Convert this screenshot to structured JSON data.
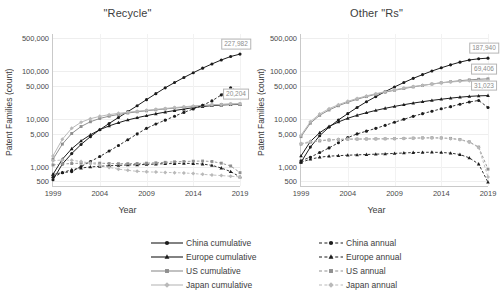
{
  "figure": {
    "xlabel": "Year",
    "ylabel": "Patent Families (count)"
  },
  "colors": {
    "china": "#1c1c1c",
    "europe": "#1c1c1c",
    "us": "#8f8f8f",
    "japan": "#b9b9b9",
    "grid": "#eeeeee",
    "axis": "#c9c9c9",
    "callout_text": "#8d8d8d"
  },
  "legend": {
    "left_column": [
      {
        "label": "China cumulative",
        "series": "china",
        "style": "solid",
        "marker": "circle"
      },
      {
        "label": "Europe cumulative",
        "series": "europe",
        "style": "solid",
        "marker": "triangle"
      },
      {
        "label": "US cumulative",
        "series": "us",
        "style": "solid",
        "marker": "square"
      },
      {
        "label": "Japan cumulative",
        "series": "japan",
        "style": "solid",
        "marker": "diamond"
      }
    ],
    "right_column": [
      {
        "label": "China annual",
        "series": "china",
        "style": "dashed",
        "marker": "circle"
      },
      {
        "label": "Europe annual",
        "series": "europe",
        "style": "dashed",
        "marker": "triangle"
      },
      {
        "label": "US annual",
        "series": "us",
        "style": "dashed",
        "marker": "square"
      },
      {
        "label": "Japan annual",
        "series": "japan",
        "style": "dashed",
        "marker": "diamond"
      }
    ]
  },
  "chart_data": [
    {
      "panel": "left",
      "type": "line",
      "title": "\"Recycle\"",
      "xlabel": "Year",
      "ylabel": "Patent Families (count)",
      "yscale": "log",
      "ylim": [
        400,
        600000
      ],
      "xlim": [
        1999,
        2019
      ],
      "grid": true,
      "legend_position": "below-figure",
      "yticks": [
        500,
        1000,
        5000,
        10000,
        50000,
        100000,
        500000
      ],
      "ytick_labels": [
        "500",
        "1,000",
        "5,000",
        "10,000",
        "50,000",
        "100,000",
        "500,000"
      ],
      "xticks": [
        1999,
        2004,
        2009,
        2014,
        2019
      ],
      "xtick_labels": [
        "1999",
        "2004",
        "2009",
        "2014",
        "2019"
      ],
      "x": [
        1999,
        2000,
        2001,
        2002,
        2003,
        2004,
        2005,
        2006,
        2007,
        2008,
        2009,
        2010,
        2011,
        2012,
        2013,
        2014,
        2015,
        2016,
        2017,
        2018,
        2019
      ],
      "series": [
        {
          "name": "China cumulative",
          "key": "china",
          "style": "solid",
          "marker": "circle",
          "values": [
            540,
            1150,
            1900,
            2950,
            4300,
            6000,
            8100,
            10800,
            14300,
            19000,
            25500,
            34000,
            45000,
            58000,
            74000,
            93000,
            116000,
            142000,
            172000,
            203000,
            227982
          ]
        },
        {
          "name": "Europe cumulative",
          "key": "europe",
          "style": "solid",
          "marker": "triangle",
          "values": [
            700,
            1450,
            2400,
            3500,
            4700,
            6000,
            7200,
            8400,
            9600,
            10700,
            11800,
            12900,
            14000,
            15100,
            16200,
            17300,
            18300,
            19100,
            19700,
            20100,
            20204
          ]
        },
        {
          "name": "US cumulative",
          "key": "us",
          "style": "solid",
          "marker": "square",
          "values": [
            1450,
            3000,
            5000,
            7000,
            8800,
            10300,
            11500,
            12500,
            13400,
            14200,
            14900,
            15600,
            16300,
            17000,
            17700,
            18400,
            19100,
            19700,
            20200,
            20600,
            20800
          ]
        },
        {
          "name": "Japan cumulative",
          "key": "japan",
          "style": "solid",
          "marker": "diamond",
          "values": [
            1700,
            3800,
            6400,
            8600,
            10200,
            11400,
            12400,
            13200,
            13900,
            14600,
            15300,
            16000,
            16700,
            17400,
            18100,
            18800,
            19400,
            19900,
            20300,
            20600,
            20800
          ]
        },
        {
          "name": "China annual",
          "key": "china",
          "style": "dashed",
          "marker": "circle",
          "values": [
            610,
            760,
            800,
            1020,
            1300,
            1650,
            2150,
            2800,
            3700,
            4900,
            6400,
            7900,
            9500,
            11500,
            13800,
            16300,
            19500,
            24000,
            32000,
            45000,
            37000
          ]
        },
        {
          "name": "Europe annual",
          "key": "europe",
          "style": "dashed",
          "marker": "triangle",
          "values": [
            700,
            760,
            880,
            950,
            1000,
            1030,
            1060,
            1080,
            1100,
            1110,
            1130,
            1150,
            1170,
            1180,
            1190,
            1180,
            1150,
            1080,
            950,
            800,
            620
          ]
        },
        {
          "name": "US annual",
          "key": "us",
          "style": "dashed",
          "marker": "square",
          "values": [
            1100,
            1150,
            1180,
            1200,
            1210,
            1200,
            1180,
            1170,
            1170,
            1180,
            1200,
            1220,
            1250,
            1280,
            1300,
            1320,
            1330,
            1300,
            1200,
            1050,
            760
          ]
        },
        {
          "name": "Japan annual",
          "key": "japan",
          "style": "dashed",
          "marker": "diamond",
          "values": [
            1350,
            1400,
            1380,
            1300,
            1200,
            1080,
            980,
            900,
            850,
            810,
            790,
            780,
            770,
            760,
            750,
            730,
            700,
            680,
            660,
            640,
            620
          ]
        }
      ],
      "annotations": [
        {
          "text": "227,982",
          "series": "China cumulative",
          "x": 2019,
          "y": 227982
        },
        {
          "text": "20,204",
          "series": "Europe cumulative",
          "x": 2019,
          "y": 20204
        }
      ]
    },
    {
      "panel": "right",
      "type": "line",
      "title": "Other \"Rs\"",
      "xlabel": "Year",
      "ylabel": "Patent Families (count)",
      "yscale": "log",
      "ylim": [
        400,
        600000
      ],
      "xlim": [
        1999,
        2019
      ],
      "grid": true,
      "legend_position": "below-figure",
      "yticks": [
        500,
        1000,
        5000,
        10000,
        50000,
        100000,
        500000
      ],
      "ytick_labels": [
        "500",
        "1,000",
        "5,000",
        "10,000",
        "50,000",
        "100,000",
        "500,000"
      ],
      "xticks": [
        1999,
        2004,
        2009,
        2014,
        2019
      ],
      "xtick_labels": [
        "1999",
        "2004",
        "2009",
        "2014",
        "2019"
      ],
      "x": [
        1999,
        2000,
        2001,
        2002,
        2003,
        2004,
        2005,
        2006,
        2007,
        2008,
        2009,
        2010,
        2011,
        2012,
        2013,
        2014,
        2015,
        2016,
        2017,
        2018,
        2019
      ],
      "series": [
        {
          "name": "China cumulative",
          "key": "china",
          "style": "solid",
          "marker": "circle",
          "values": [
            1250,
            2600,
            4500,
            6800,
            9600,
            13000,
            17500,
            23000,
            29500,
            37500,
            47000,
            58000,
            71000,
            85000,
            101000,
            118000,
            136000,
            155000,
            172000,
            182000,
            187940
          ]
        },
        {
          "name": "Europe cumulative",
          "key": "europe",
          "style": "solid",
          "marker": "triangle",
          "values": [
            1700,
            3400,
            5200,
            7000,
            8700,
            10400,
            12000,
            13600,
            15200,
            16800,
            18400,
            20000,
            21600,
            23100,
            24600,
            26000,
            27400,
            28700,
            29800,
            30600,
            31023
          ]
        },
        {
          "name": "US cumulative",
          "key": "us",
          "style": "solid",
          "marker": "square",
          "values": [
            4300,
            8200,
            12000,
            15500,
            19000,
            22500,
            26000,
            29500,
            33000,
            36500,
            40000,
            43500,
            47000,
            50500,
            54000,
            57500,
            60500,
            63500,
            66000,
            68000,
            69406
          ]
        },
        {
          "name": "Japan cumulative",
          "key": "japan",
          "style": "solid",
          "marker": "diamond",
          "values": [
            4600,
            8800,
            12800,
            16500,
            20000,
            23500,
            27000,
            30500,
            34000,
            37500,
            41000,
            44500,
            48000,
            51000,
            54000,
            57000,
            59500,
            61500,
            63000,
            64000,
            64500
          ]
        },
        {
          "name": "China annual",
          "key": "china",
          "style": "dashed",
          "marker": "circle",
          "values": [
            1350,
            1600,
            2000,
            2500,
            3200,
            4100,
            4900,
            5600,
            6400,
            7400,
            8600,
            9900,
            11400,
            13000,
            14600,
            16400,
            18200,
            20500,
            22800,
            24500,
            17500
          ]
        },
        {
          "name": "Europe annual",
          "key": "europe",
          "style": "dashed",
          "marker": "triangle",
          "values": [
            1250,
            1450,
            1600,
            1680,
            1720,
            1760,
            1790,
            1820,
            1850,
            1880,
            1920,
            1960,
            2000,
            2020,
            2030,
            2010,
            1950,
            1820,
            1550,
            1150,
            480
          ]
        },
        {
          "name": "US annual",
          "key": "us",
          "style": "dashed",
          "marker": "square",
          "values": [
            3000,
            3300,
            3500,
            3650,
            3750,
            3800,
            3820,
            3840,
            3860,
            3880,
            3900,
            3950,
            4000,
            4050,
            4080,
            4050,
            3950,
            3750,
            3350,
            2600,
            900
          ]
        },
        {
          "name": "Japan annual",
          "key": "japan",
          "style": "dashed",
          "marker": "diamond",
          "values": [
            3100,
            3400,
            3600,
            3700,
            3780,
            3820,
            3840,
            3850,
            3860,
            3880,
            3900,
            3950,
            4000,
            4020,
            4030,
            3980,
            3880,
            3700,
            3300,
            2550,
            620
          ]
        }
      ],
      "annotations": [
        {
          "text": "187,940",
          "series": "China cumulative",
          "x": 2019,
          "y": 187940
        },
        {
          "text": "69,406",
          "series": "US cumulative",
          "x": 2019,
          "y": 69406
        },
        {
          "text": "31,023",
          "series": "Europe cumulative",
          "x": 2019,
          "y": 31023
        }
      ]
    }
  ]
}
